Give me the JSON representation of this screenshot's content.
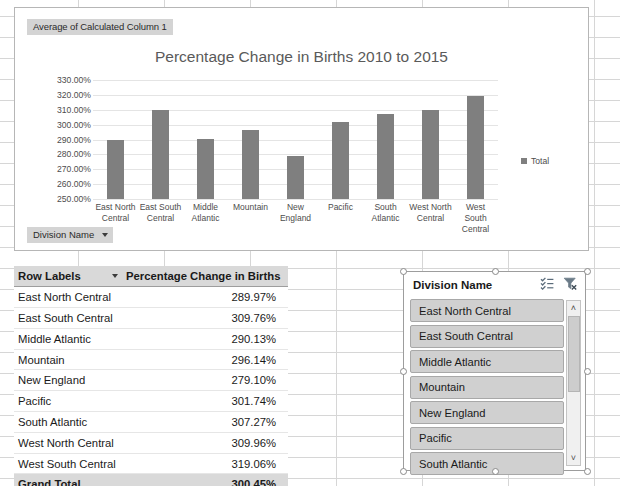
{
  "chart_object": {
    "pivot_value_field_label": "Average of Calculated Column 1",
    "axis_field_label": "Division Name",
    "legend_label": "Total"
  },
  "chart_data": {
    "type": "bar",
    "title": "Percentage Change in Births 2010 to 2015",
    "xlabel": "",
    "ylabel": "",
    "categories": [
      "East North Central",
      "East South Central",
      "Middle Atlantic",
      "Mountain",
      "New England",
      "Pacific",
      "South Atlantic",
      "West North Central",
      "West South Central"
    ],
    "series": [
      {
        "name": "Total",
        "values": [
          289.97,
          309.76,
          290.13,
          296.14,
          279.1,
          301.74,
          307.27,
          309.96,
          319.06
        ]
      }
    ],
    "ylim": [
      250,
      330
    ],
    "ytick_step": 10,
    "ytick_labels": [
      "330.00%",
      "320.00%",
      "310.00%",
      "300.00%",
      "290.00%",
      "280.00%",
      "270.00%",
      "260.00%",
      "250.00%"
    ],
    "grid": true,
    "legend_position": "right",
    "bar_color": "#7f7f7f"
  },
  "pivot_table": {
    "columns": [
      "Row Labels",
      "Percentage Change in Births"
    ],
    "rows": [
      {
        "label": "East North Central",
        "value": "289.97%"
      },
      {
        "label": "East South Central",
        "value": "309.76%"
      },
      {
        "label": "Middle Atlantic",
        "value": "290.13%"
      },
      {
        "label": "Mountain",
        "value": "296.14%"
      },
      {
        "label": "New England",
        "value": "279.10%"
      },
      {
        "label": "Pacific",
        "value": "301.74%"
      },
      {
        "label": "South Atlantic",
        "value": "307.27%"
      },
      {
        "label": "West North Central",
        "value": "309.96%"
      },
      {
        "label": "West South Central",
        "value": "319.06%"
      }
    ],
    "grand_total": {
      "label": "Grand Total",
      "value": "300.45%"
    }
  },
  "slicer": {
    "title": "Division Name",
    "multi_select_icon": "multi-select-icon",
    "clear_filter_icon": "clear-filter-icon",
    "items": [
      "East North Central",
      "East South Central",
      "Middle Atlantic",
      "Mountain",
      "New England",
      "Pacific",
      "South Atlantic"
    ],
    "scroll_up": "˄",
    "scroll_down": "˅"
  },
  "colors": {
    "bar": "#7f7f7f",
    "header_fill": "#d9d9d9",
    "slicer_item_fill": "#d0d0d0"
  }
}
